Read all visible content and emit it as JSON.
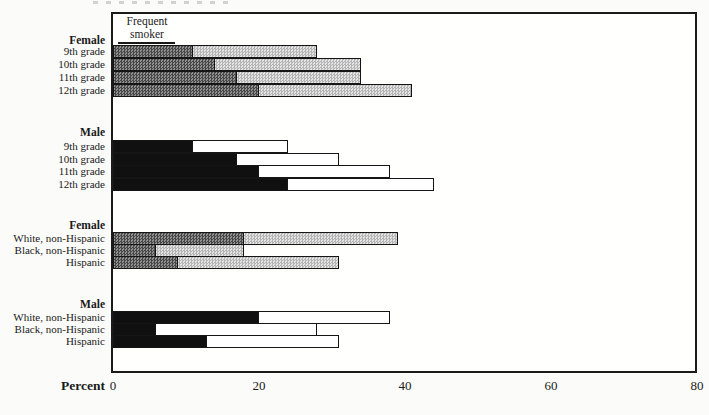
{
  "figure": {
    "xlabel": "Percent",
    "legend": {
      "line1": "Frequent",
      "line2": "smoker"
    }
  },
  "chart_data": {
    "type": "bar",
    "orientation": "horizontal-stacked",
    "title": "",
    "xlabel": "Percent",
    "xlim": [
      0,
      80
    ],
    "x_ticks": [
      0,
      20,
      40,
      60,
      80
    ],
    "grid": false,
    "legend_label": "Frequent smoker",
    "series_names": [
      "Frequent smoker",
      "Total current smoker"
    ],
    "groups": [
      {
        "header": "Female",
        "style": "gray",
        "rows": [
          {
            "label": "9th grade",
            "frequent_smoker": 11,
            "total": 28
          },
          {
            "label": "10th grade",
            "frequent_smoker": 14,
            "total": 34
          },
          {
            "label": "11th grade",
            "frequent_smoker": 17,
            "total": 34
          },
          {
            "label": "12th grade",
            "frequent_smoker": 20,
            "total": 41
          }
        ]
      },
      {
        "header": "Male",
        "style": "black",
        "rows": [
          {
            "label": "9th grade",
            "frequent_smoker": 11,
            "total": 24
          },
          {
            "label": "10th grade",
            "frequent_smoker": 17,
            "total": 31
          },
          {
            "label": "11th grade",
            "frequent_smoker": 20,
            "total": 38
          },
          {
            "label": "12th grade",
            "frequent_smoker": 24,
            "total": 44
          }
        ]
      },
      {
        "header": "Female",
        "style": "gray",
        "rows": [
          {
            "label": "White, non-Hispanic",
            "frequent_smoker": 18,
            "total": 39
          },
          {
            "label": "Black, non-Hispanic",
            "frequent_smoker": 6,
            "total": 18
          },
          {
            "label": "Hispanic",
            "frequent_smoker": 9,
            "total": 31
          }
        ]
      },
      {
        "header": "Male",
        "style": "black",
        "rows": [
          {
            "label": "White, non-Hispanic",
            "frequent_smoker": 20,
            "total": 38
          },
          {
            "label": "Black, non-Hispanic",
            "frequent_smoker": 6,
            "total": 28
          },
          {
            "label": "Hispanic",
            "frequent_smoker": 13,
            "total": 31
          }
        ]
      }
    ],
    "colors": {
      "female_frequent_dark": "#474747",
      "female_frequent_light": "#909090",
      "female_rest_dark": "#b4b4b4",
      "female_rest_light": "#e4e4e4",
      "male_frequent": "#101010",
      "male_rest": "#ffffff",
      "outline": "#151515"
    }
  }
}
